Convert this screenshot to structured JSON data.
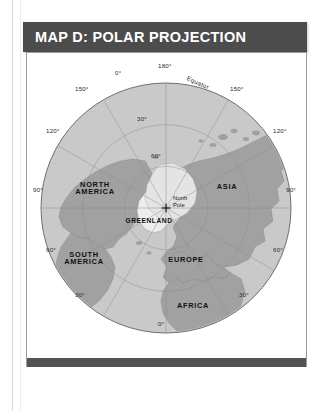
{
  "page": {
    "title_bar_color": "#4c4c4c",
    "footer_bar_color": "#535353",
    "panel_border_color": "#9b9b9b"
  },
  "header": {
    "title": "MAP D: POLAR PROJECTION"
  },
  "map": {
    "projection": "Polar Projection",
    "center_label": "North\nPole",
    "ocean_color": "#c9c9c9",
    "land_color": "#a2a2a2",
    "ice_color": "#ededed",
    "graticule_color": "#8e8e8e",
    "outline_color": "#6e6e6e",
    "pole_marker": "plus-marker",
    "center": {
      "cx": 139,
      "cy": 155,
      "r": 125
    },
    "equator_label": "Equator",
    "pole_label_line1": "North",
    "pole_label_line2": "Pole",
    "outer_labels": [
      {
        "text": "180°",
        "x": 131,
        "y": 10
      },
      {
        "text": "0°",
        "x": 88,
        "y": 17
      },
      {
        "text": "150°",
        "x": 48,
        "y": 33
      },
      {
        "text": "120°",
        "x": 19,
        "y": 75
      },
      {
        "text": "90°",
        "x": 6,
        "y": 134
      },
      {
        "text": "60°",
        "x": 19,
        "y": 194
      },
      {
        "text": "30°",
        "x": 48,
        "y": 239
      },
      {
        "text": "0°",
        "x": 131,
        "y": 268
      },
      {
        "text": "30°",
        "x": 212,
        "y": 239
      },
      {
        "text": "60°",
        "x": 246,
        "y": 194
      },
      {
        "text": "90°",
        "x": 259,
        "y": 134
      },
      {
        "text": "120°",
        "x": 246,
        "y": 75
      },
      {
        "text": "150°",
        "x": 203,
        "y": 33
      }
    ],
    "inner_labels": [
      {
        "text": "30°",
        "x": 110,
        "y": 63
      },
      {
        "text": "60°",
        "x": 124,
        "y": 100
      }
    ],
    "continent_labels": [
      {
        "name": "NORTH AMERICA",
        "line1": "NORTH",
        "line2": "AMERICA",
        "x": 68,
        "y": 128
      },
      {
        "name": "SOUTH AMERICA",
        "line1": "SOUTH",
        "line2": "AMERICA",
        "x": 57,
        "y": 198
      },
      {
        "name": "GREENLAND",
        "line1": "GREENLAND",
        "line2": "",
        "x": 122,
        "y": 165
      },
      {
        "name": "ASIA",
        "line1": "ASIA",
        "line2": "",
        "x": 200,
        "y": 130
      },
      {
        "name": "EUROPE",
        "line1": "EUROPE",
        "line2": "",
        "x": 159,
        "y": 203
      },
      {
        "name": "AFRICA",
        "line1": "AFRICA",
        "line2": "",
        "x": 166,
        "y": 249
      }
    ]
  }
}
